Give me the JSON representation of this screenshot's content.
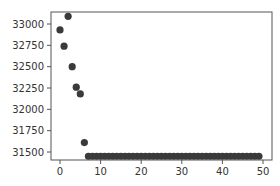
{
  "chart_data": {
    "type": "scatter",
    "title": "",
    "xlabel": "",
    "ylabel": "",
    "xlim": [
      -2,
      51
    ],
    "ylim": [
      31360,
      33160
    ],
    "grid": false,
    "legend": null,
    "x_ticks": [
      0,
      10,
      20,
      30,
      40,
      50
    ],
    "y_ticks": [
      31500,
      31750,
      32000,
      32250,
      32500,
      32750,
      33000
    ],
    "marker_color": "#3a3a3a",
    "x": [
      0,
      1,
      2,
      3,
      4,
      5,
      6,
      7,
      8,
      9,
      10,
      11,
      12,
      13,
      14,
      15,
      16,
      17,
      18,
      19,
      20,
      21,
      22,
      23,
      24,
      25,
      26,
      27,
      28,
      29,
      30,
      31,
      32,
      33,
      34,
      35,
      36,
      37,
      38,
      39,
      40,
      41,
      42,
      43,
      44,
      45,
      46,
      47,
      48,
      49
    ],
    "y": [
      32930,
      32740,
      33090,
      32500,
      32260,
      32180,
      31610,
      31450,
      31450,
      31450,
      31450,
      31450,
      31450,
      31450,
      31450,
      31450,
      31450,
      31450,
      31450,
      31450,
      31450,
      31450,
      31450,
      31450,
      31450,
      31450,
      31450,
      31450,
      31450,
      31450,
      31450,
      31450,
      31450,
      31450,
      31450,
      31450,
      31450,
      31450,
      31450,
      31450,
      31450,
      31450,
      31450,
      31450,
      31450,
      31450,
      31450,
      31450,
      31450,
      31450
    ]
  }
}
